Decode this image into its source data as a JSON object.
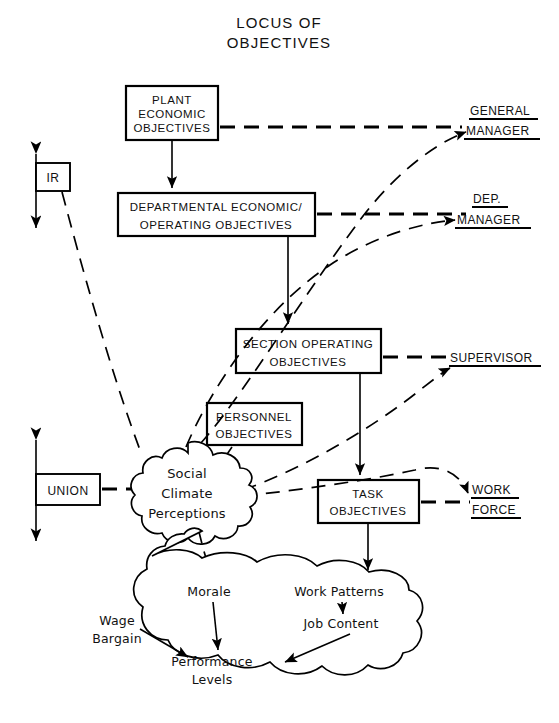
{
  "title": {
    "line1": "LOCUS OF",
    "line2": "OBJECTIVES"
  },
  "boxes": {
    "plant": {
      "lines": [
        "PLANT",
        "ECONOMIC",
        "OBJECTIVES"
      ]
    },
    "departmental": {
      "lines": [
        "DEPARTMENTAL  ECONOMIC/",
        "OPERATING   OBJECTIVES"
      ]
    },
    "section": {
      "lines": [
        "SECTION OPERATING",
        "OBJECTIVES"
      ]
    },
    "personnel": {
      "lines": [
        "PERSONNEL",
        "OBJECTIVES"
      ]
    },
    "task": {
      "lines": [
        "TASK",
        "OBJECTIVES"
      ]
    },
    "ir": {
      "label": "IR"
    },
    "union": {
      "label": "UNION"
    }
  },
  "roles": {
    "general_manager": {
      "line1": "GENERAL",
      "line2": "MANAGER"
    },
    "dep_manager": {
      "line1": "DEP.",
      "line2": "MANAGER"
    },
    "supervisor": {
      "line1": "SUPERVISOR"
    },
    "work_force": {
      "line1": "WORK",
      "line2": "FORCE"
    }
  },
  "clouds": {
    "social_climate": {
      "lines": [
        "Social",
        "Climate",
        "Perceptions"
      ]
    },
    "outcomes": {
      "morale": "Morale",
      "work_patterns": "Work Patterns",
      "wage_bargain_l1": "Wage",
      "wage_bargain_l2": "Bargain",
      "job_content": "Job Content",
      "performance_l1": "Performance",
      "performance_l2": "Levels"
    }
  },
  "annotations": {
    "question_mark": "?"
  },
  "colors": {
    "ink": "#000000",
    "paper": "#ffffff"
  }
}
